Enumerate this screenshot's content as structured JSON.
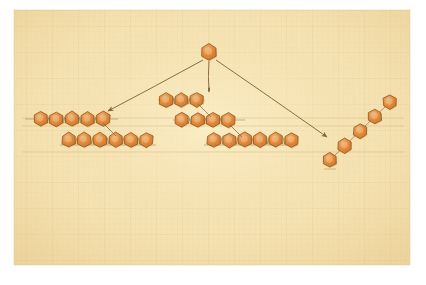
{
  "diagram": {
    "title_label": "GLUCOSE",
    "medium": "hand-drawn pencil and orange wash on gridded graph paper",
    "paper_color": "#f6e3b4",
    "grid_color": "#e2c98e",
    "ink_color": "#8a6a3a",
    "hex_fill": "#e08a3c",
    "hex_fill_light": "#eda45c",
    "hex_stroke": "#9c5a22",
    "border_color": "#ffffff"
  },
  "source_node": {
    "label": "GLUCOSE",
    "label_x": 212,
    "label_y": 38,
    "hex_cx": 209,
    "hex_cy": 52,
    "hex_r": 8
  },
  "arrows": [
    {
      "name": "arrow-to-starch",
      "x1": 203,
      "y1": 60,
      "x2": 108,
      "y2": 111
    },
    {
      "name": "arrow-to-glycogen",
      "x1": 209,
      "y1": 61,
      "x2": 209,
      "y2": 92
    },
    {
      "name": "arrow-to-cellulose",
      "x1": 216,
      "y1": 60,
      "x2": 327,
      "y2": 137
    }
  ],
  "chains": [
    {
      "name": "starch-chain-upper",
      "count": 5,
      "start_x": 41,
      "start_y": 119,
      "step_x": 15.5,
      "step_y": 0,
      "baseline": {
        "x1": 25,
        "y1": 119,
        "x2": 118,
        "y2": 119
      }
    },
    {
      "name": "starch-chain-lower",
      "count": 6,
      "start_x": 69,
      "start_y": 140,
      "step_x": 15.5,
      "step_y": 0,
      "baseline": {
        "x1": 60,
        "y1": 145,
        "x2": 156,
        "y2": 145
      }
    },
    {
      "name": "glycogen-chain-top",
      "count": 3,
      "start_x": 166,
      "start_y": 100,
      "step_x": 15.5,
      "step_y": 0,
      "baseline": {
        "x1": 158,
        "y1": 100,
        "x2": 205,
        "y2": 100
      }
    },
    {
      "name": "glycogen-chain-middle",
      "count": 4,
      "start_x": 182,
      "start_y": 120,
      "step_x": 15.5,
      "step_y": 0,
      "baseline": {
        "x1": 173,
        "y1": 120,
        "x2": 245,
        "y2": 120
      }
    },
    {
      "name": "glycogen-chain-bottom",
      "count": 6,
      "start_x": 214,
      "start_y": 140,
      "step_x": 15.5,
      "step_y": 0,
      "baseline": {
        "x1": 204,
        "y1": 145,
        "x2": 298,
        "y2": 145
      }
    }
  ],
  "branch_links": [
    {
      "name": "branch-link-starch",
      "x1": 103,
      "y1": 123,
      "x2": 116,
      "y2": 136
    },
    {
      "name": "branch-link-glycogen-top",
      "x1": 198,
      "y1": 104,
      "x2": 211,
      "y2": 117
    },
    {
      "name": "branch-link-glycogen-middle",
      "x1": 229,
      "y1": 124,
      "x2": 242,
      "y2": 137
    }
  ],
  "staircase": {
    "name": "cellulose-staircase",
    "count": 5,
    "start_x": 330,
    "start_y": 160,
    "step_x": 15,
    "step_y": -14.5
  },
  "panels": [
    {
      "name": "panel-starch-unbleached",
      "label_line1": "STARCH",
      "label_line2": "(UNBLEACHED)",
      "x": 33,
      "y": 153,
      "w": 60,
      "h": 66,
      "label_x": 62,
      "label_y": 230,
      "pattern": "parallel-wavy-fibers"
    },
    {
      "name": "panel-starch-bleached",
      "label_line1": "STARCH",
      "label_line2": "(BLEACHED)",
      "x": 94,
      "y": 153,
      "w": 63,
      "h": 66,
      "label_x": 125,
      "label_y": 230,
      "pattern": "branched-fibers"
    },
    {
      "name": "panel-glycogen",
      "label_line1": "GLYCOGEN",
      "label_line2": "",
      "x": 190,
      "y": 153,
      "w": 84,
      "h": 66,
      "label_x": 232,
      "label_y": 230,
      "pattern": "tangled-loops"
    }
  ],
  "guide_lines": [
    {
      "name": "guide-line-top",
      "x1": 22,
      "y1": 118,
      "x2": 404,
      "y2": 118
    },
    {
      "name": "guide-line-middle",
      "x1": 22,
      "y1": 126,
      "x2": 404,
      "y2": 126
    },
    {
      "name": "guide-line-lower",
      "x1": 22,
      "y1": 152,
      "x2": 404,
      "y2": 152
    }
  ],
  "paper": {
    "x": 14,
    "y": 10,
    "w": 396,
    "h": 255
  }
}
